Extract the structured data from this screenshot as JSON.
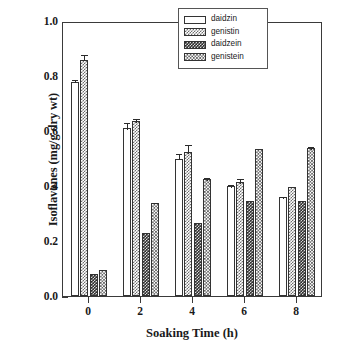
{
  "chart_data": {
    "type": "bar",
    "title": "",
    "xlabel": "Soaking Time (h)",
    "ylabel": "Isoflavones (mg/g dry wt)",
    "categories": [
      "0",
      "2",
      "4",
      "6",
      "8"
    ],
    "xlim": [
      -1,
      9
    ],
    "ylim": [
      0.0,
      1.0
    ],
    "ytick_labels": [
      "0.0",
      "0.2",
      "0.4",
      "0.6",
      "0.8",
      "1.0"
    ],
    "ytick_values": [
      0.0,
      0.2,
      0.4,
      0.6,
      0.8,
      1.0
    ],
    "xtick_labels": [
      "0",
      "2",
      "4",
      "6",
      "8"
    ],
    "grid": false,
    "legend_position": "top-right",
    "series": [
      {
        "name": "daidzin",
        "pattern": "empty",
        "values": [
          0.78,
          0.61,
          0.5,
          0.4,
          0.36
        ],
        "errors": [
          0.012,
          0.025,
          0.022,
          0.012,
          0.006
        ]
      },
      {
        "name": "genistin",
        "pattern": "light-checker",
        "values": [
          0.86,
          0.635,
          0.525,
          0.415,
          0.395
        ],
        "errors": [
          0.022,
          0.015,
          0.03,
          0.018,
          0.0
        ]
      },
      {
        "name": "daidzein",
        "pattern": "dark-checker",
        "values": [
          0.08,
          0.23,
          0.265,
          0.345,
          0.345
        ],
        "errors": [
          0.0,
          0.0,
          0.0,
          0.0,
          0.0
        ]
      },
      {
        "name": "genistein",
        "pattern": "medium-checker",
        "values": [
          0.095,
          0.34,
          0.425,
          0.535,
          0.54
        ],
        "errors": [
          0.0,
          0.006,
          0.01,
          0.0,
          0.01
        ]
      }
    ]
  },
  "legend": {
    "items": [
      {
        "label": "daidzin"
      },
      {
        "label": "genistin"
      },
      {
        "label": "daidzein"
      },
      {
        "label": "genistein"
      }
    ]
  },
  "axes": {
    "y_title": "Isoflavones (mg/g dry wt)",
    "x_title": "Soaking Time (h)"
  },
  "colors": {
    "axis": "#3a3a3a",
    "text": "#1a1a1a",
    "bar_outline": "#333333",
    "pattern_light": "#6e6e6e",
    "pattern_dark": "#2e2e2e",
    "pattern_medium": "#585858",
    "background": "#ffffff"
  }
}
